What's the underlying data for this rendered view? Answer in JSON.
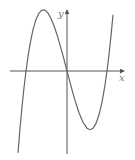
{
  "figure": {
    "type": "function-graph",
    "axes": {
      "x_label": "x",
      "y_label": "y"
    },
    "colors": {
      "axis": "#555555",
      "curve": "#666666",
      "label": "#777777"
    }
  }
}
